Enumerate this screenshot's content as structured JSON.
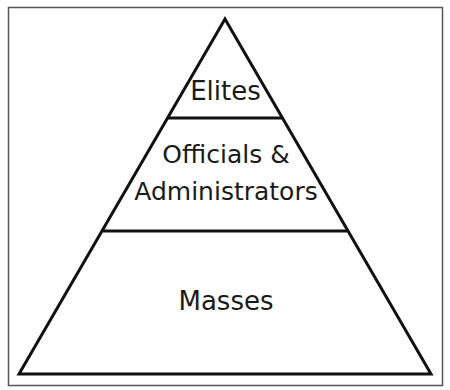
{
  "diagram": {
    "type": "pyramid",
    "levels": [
      {
        "label_lines": [
          "Elites"
        ]
      },
      {
        "label_lines": [
          "Officials &",
          "Administrators"
        ]
      },
      {
        "label_lines": [
          "Masses"
        ]
      }
    ],
    "colors": {
      "stroke": "#111111",
      "frame": "#555555",
      "fill": "#ffffff",
      "text": "#1a1a1a"
    }
  }
}
